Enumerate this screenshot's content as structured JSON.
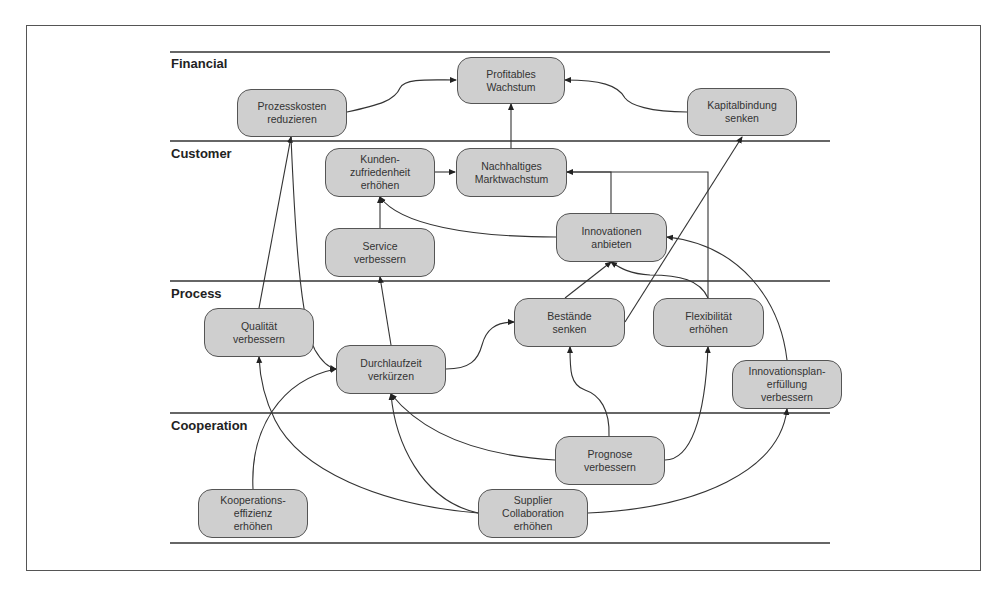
{
  "lanes": [
    {
      "id": "financial",
      "label": "Financial"
    },
    {
      "id": "customer",
      "label": "Customer"
    },
    {
      "id": "process",
      "label": "Process"
    },
    {
      "id": "cooperation",
      "label": "Cooperation"
    }
  ],
  "nodes": {
    "profitables_wachstum": {
      "lane": "Financial",
      "lines": [
        "Profitables",
        "Wachstum"
      ]
    },
    "prozesskosten": {
      "lane": "Financial",
      "lines": [
        "Prozesskosten",
        "reduzieren"
      ]
    },
    "kapitalbindung": {
      "lane": "Financial",
      "lines": [
        "Kapitalbindung",
        "senken"
      ]
    },
    "kundenzufriedenheit": {
      "lane": "Customer",
      "lines": [
        "Kunden-",
        "zufriedenheit",
        "erhöhen"
      ]
    },
    "marktwachstum": {
      "lane": "Customer",
      "lines": [
        "Nachhaltiges",
        "Marktwachstum"
      ]
    },
    "innovationen": {
      "lane": "Customer",
      "lines": [
        "Innovationen",
        "anbieten"
      ]
    },
    "service": {
      "lane": "Customer",
      "lines": [
        "Service",
        "verbessern"
      ]
    },
    "qualitaet": {
      "lane": "Process",
      "lines": [
        "Qualität",
        "verbessern"
      ]
    },
    "bestaende": {
      "lane": "Process",
      "lines": [
        "Bestände",
        "senken"
      ]
    },
    "flexibilitaet": {
      "lane": "Process",
      "lines": [
        "Flexibilität",
        "erhöhen"
      ]
    },
    "durchlaufzeit": {
      "lane": "Process",
      "lines": [
        "Durchlaufzeit",
        "verkürzen"
      ]
    },
    "innovationsplan": {
      "lane": "Process",
      "lines": [
        "Innovationsplan-",
        "erfüllung",
        "verbessern"
      ]
    },
    "prognose": {
      "lane": "Cooperation",
      "lines": [
        "Prognose",
        "verbessern"
      ]
    },
    "kooperationseffizienz": {
      "lane": "Cooperation",
      "lines": [
        "Kooperations-",
        "effizienz",
        "erhöhen"
      ]
    },
    "supplier": {
      "lane": "Cooperation",
      "lines": [
        "Supplier",
        "Collaboration",
        "erhöhen"
      ]
    }
  },
  "edges": [
    {
      "from": "Prozesskosten reduzieren",
      "to": "Profitables Wachstum"
    },
    {
      "from": "Kapitalbindung senken",
      "to": "Profitables Wachstum"
    },
    {
      "from": "Nachhaltiges Marktwachstum",
      "to": "Profitables Wachstum"
    },
    {
      "from": "Kundenzufriedenheit erhöhen",
      "to": "Nachhaltiges Marktwachstum"
    },
    {
      "from": "Innovationen anbieten",
      "to": "Nachhaltiges Marktwachstum"
    },
    {
      "from": "Flexibilität erhöhen",
      "to": "Nachhaltiges Marktwachstum"
    },
    {
      "from": "Innovationen anbieten",
      "to": "Kundenzufriedenheit erhöhen"
    },
    {
      "from": "Service verbessern",
      "to": "Kundenzufriedenheit erhöhen"
    },
    {
      "from": "Qualität verbessern",
      "to": "Prozesskosten reduzieren"
    },
    {
      "from": "Prozesskosten reduzieren",
      "to": "Durchlaufzeit verkürzen"
    },
    {
      "from": "Bestände senken",
      "to": "Kapitalbindung senken"
    },
    {
      "from": "Bestände senken",
      "to": "Innovationen anbieten"
    },
    {
      "from": "Flexibilität erhöhen",
      "to": "Innovationen anbieten"
    },
    {
      "from": "Innovationsplanerfüllung verbessern",
      "to": "Innovationen anbieten"
    },
    {
      "from": "Durchlaufzeit verkürzen",
      "to": "Service verbessern"
    },
    {
      "from": "Durchlaufzeit verkürzen",
      "to": "Bestände senken"
    },
    {
      "from": "Prognose verbessern",
      "to": "Bestände senken"
    },
    {
      "from": "Prognose verbessern",
      "to": "Flexibilität erhöhen"
    },
    {
      "from": "Prognose verbessern",
      "to": "Durchlaufzeit verkürzen"
    },
    {
      "from": "Kooperationseffizienz erhöhen",
      "to": "Durchlaufzeit verkürzen"
    },
    {
      "from": "Supplier Collaboration erhöhen",
      "to": "Qualität verbessern"
    },
    {
      "from": "Supplier Collaboration erhöhen",
      "to": "Durchlaufzeit verkürzen"
    },
    {
      "from": "Supplier Collaboration erhöhen",
      "to": "Innovationsplanerfüllung verbessern"
    }
  ],
  "colors": {
    "node_fill": "#cfcfcf",
    "node_border": "#555555",
    "line": "#333333",
    "background": "#ffffff"
  }
}
